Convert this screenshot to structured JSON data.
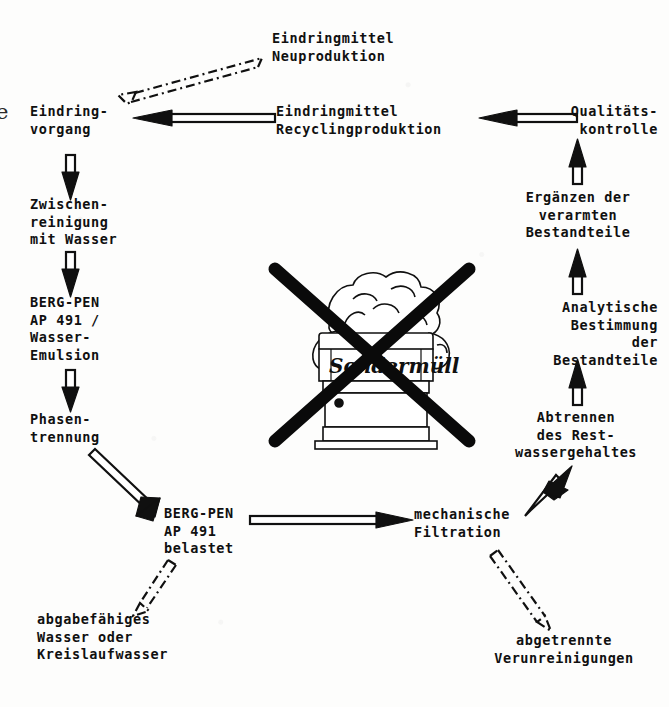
{
  "figure": {
    "kind": "process-flow-diagram",
    "language": "de",
    "ink_color": "#101010",
    "background_color": "#fdfdfc"
  },
  "page_bleed": {
    "glyph": "e"
  },
  "nodes": [
    {
      "id": "eindringmittel-neuproduktion",
      "label": "Eindringmittel\nNeuproduktion",
      "align": "left"
    },
    {
      "id": "eindringvorgang",
      "label": "Eindring-\nvorgang",
      "align": "left"
    },
    {
      "id": "eindringmittel-recycling",
      "label": "Eindringmittel\nRecyclingproduktion",
      "align": "left"
    },
    {
      "id": "qualitaetskontrolle",
      "label": "Qualitäts-\nkontrolle",
      "align": "right"
    },
    {
      "id": "zwischenreinigung",
      "label": "Zwischen-\nreinigung\nmit Wasser",
      "align": "left"
    },
    {
      "id": "ergaenzen-bestandteile",
      "label": "Ergänzen der\nverarmten\nBestandteile",
      "align": "center"
    },
    {
      "id": "berg-pen-emulsion",
      "label": "BERG-PEN\nAP 491 /\nWasser-\nEmulsion",
      "align": "left"
    },
    {
      "id": "analytische-bestimmung",
      "label": "Analytische\nBestimmung\nder\nBestandteile",
      "align": "right"
    },
    {
      "id": "phasentrennung",
      "label": "Phasen-\ntrennung",
      "align": "left"
    },
    {
      "id": "abtrennen-restwasser",
      "label": "Abtrennen\ndes Rest-\nwassergehaltes",
      "align": "center"
    },
    {
      "id": "berg-pen-belastet",
      "label": "BERG-PEN\nAP 491\nbelastet",
      "align": "left"
    },
    {
      "id": "mechanische-filtration",
      "label": "mechanische\nFiltration",
      "align": "left"
    },
    {
      "id": "abgabefaehiges-wasser",
      "label": "abgabefähiges\nWasser oder\nKreislaufwasser",
      "align": "left"
    },
    {
      "id": "abgetrennte-verunreinigungen",
      "label": "abgetrennte\nVerunreinigungen",
      "align": "center"
    }
  ],
  "edges": [
    {
      "id": "edge-eindringvorgang-to-neuproduktion",
      "from": "eindringvorgang",
      "to": "eindringmittel-neuproduktion",
      "style": "dash-dot-outline",
      "direction": "down-left"
    },
    {
      "id": "edge-recycling-to-eindringvorgang",
      "from": "eindringmittel-recycling",
      "to": "eindringvorgang",
      "style": "outline-solid",
      "direction": "left"
    },
    {
      "id": "edge-qualitaet-to-recycling",
      "from": "qualitaetskontrolle",
      "to": "eindringmittel-recycling",
      "style": "outline-solid",
      "direction": "left"
    },
    {
      "id": "edge-eindringvorgang-to-zwischenreinigung",
      "from": "eindringvorgang",
      "to": "zwischenreinigung",
      "style": "outline-solid",
      "direction": "down"
    },
    {
      "id": "edge-zwischenreinigung-to-bergpen",
      "from": "zwischenreinigung",
      "to": "berg-pen-emulsion",
      "style": "outline-solid",
      "direction": "down"
    },
    {
      "id": "edge-bergpen-to-phasentrennung",
      "from": "berg-pen-emulsion",
      "to": "phasentrennung",
      "style": "outline-solid",
      "direction": "down"
    },
    {
      "id": "edge-phasentrennung-to-belastet",
      "from": "phasentrennung",
      "to": "berg-pen-belastet",
      "style": "outline-solid",
      "direction": "down-right"
    },
    {
      "id": "edge-belastet-to-abgabefaehiges",
      "from": "berg-pen-belastet",
      "to": "abgabefaehiges-wasser",
      "style": "dash-dot-outline",
      "direction": "down-left"
    },
    {
      "id": "edge-belastet-to-filtration",
      "from": "berg-pen-belastet",
      "to": "mechanische-filtration",
      "style": "outline-solid",
      "direction": "right"
    },
    {
      "id": "edge-filtration-to-verunreinigungen",
      "from": "mechanische-filtration",
      "to": "abgetrennte-verunreinigungen",
      "style": "dash-dot-outline",
      "direction": "down-right"
    },
    {
      "id": "edge-filtration-to-abtrennen",
      "from": "mechanische-filtration",
      "to": "abtrennen-restwasser",
      "style": "outline-solid",
      "direction": "up-right"
    },
    {
      "id": "edge-abtrennen-to-analytische",
      "from": "abtrennen-restwasser",
      "to": "analytische-bestimmung",
      "style": "outline-solid",
      "direction": "up"
    },
    {
      "id": "edge-analytische-to-ergaenzen",
      "from": "analytische-bestimmung",
      "to": "ergaenzen-bestandteile",
      "style": "outline-solid",
      "direction": "up"
    },
    {
      "id": "edge-ergaenzen-to-qualitaet",
      "from": "ergaenzen-bestandteile",
      "to": "qualitaetskontrolle",
      "style": "outline-solid",
      "direction": "up"
    }
  ],
  "illustration": {
    "id": "sondermuell-barrel",
    "barrel_label": "Sondermüll",
    "crossed_out": true,
    "meaning": "no hazardous waste"
  }
}
